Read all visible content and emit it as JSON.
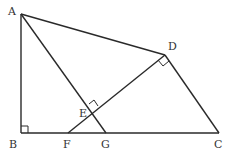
{
  "diagram": {
    "points": {
      "A": {
        "label": "A",
        "x": 21,
        "y": 14
      },
      "B": {
        "label": "B",
        "x": 21,
        "y": 133
      },
      "C": {
        "label": "C",
        "x": 219,
        "y": 133
      },
      "D": {
        "label": "D",
        "x": 165,
        "y": 55
      },
      "E": {
        "label": "E",
        "x": 92,
        "y": 109
      },
      "F": {
        "label": "F",
        "x": 68,
        "y": 133
      },
      "G": {
        "label": "G",
        "x": 106,
        "y": 133
      }
    },
    "segments": [
      "AB",
      "BC",
      "CD",
      "DA",
      "AG",
      "DF"
    ],
    "right_angles": [
      "B",
      "D",
      "E"
    ]
  }
}
